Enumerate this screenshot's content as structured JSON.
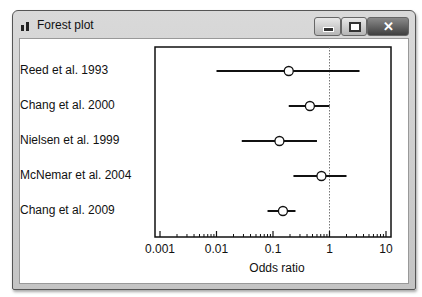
{
  "window": {
    "title": "Forest plot",
    "controls": {
      "minimize": "minimize",
      "maximize": "maximize",
      "close": "✕"
    }
  },
  "chart_data": {
    "type": "forest",
    "title": "Forest plot",
    "xlabel": "Odds ratio",
    "ylabel": "",
    "x_scale": "log",
    "xlim": [
      0.001,
      10
    ],
    "xticks": [
      "0.001",
      "0.01",
      "0.1",
      "1",
      "10"
    ],
    "reference_line": 1,
    "grid": false,
    "studies": [
      {
        "label": "Reed et al. 1993",
        "estimate": 0.19,
        "ci_low": 0.01,
        "ci_high": 3.4
      },
      {
        "label": "Chang et al. 2000",
        "estimate": 0.45,
        "ci_low": 0.19,
        "ci_high": 1.0
      },
      {
        "label": "Nielsen et al. 1999",
        "estimate": 0.13,
        "ci_low": 0.028,
        "ci_high": 0.6
      },
      {
        "label": "McNemar et al. 2004",
        "estimate": 0.72,
        "ci_low": 0.23,
        "ci_high": 2.0
      },
      {
        "label": "Chang et al. 2009",
        "estimate": 0.15,
        "ci_low": 0.08,
        "ci_high": 0.25
      }
    ]
  }
}
